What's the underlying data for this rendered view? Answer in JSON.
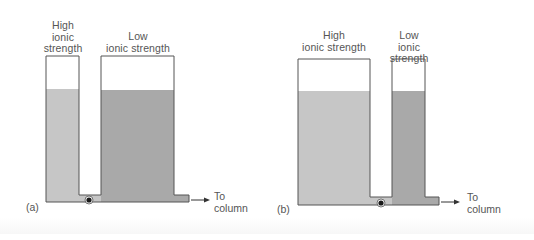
{
  "figure": {
    "panels": [
      {
        "id": "(a)",
        "left_vessel": {
          "label_lines": [
            "High",
            "ionic",
            "strength"
          ],
          "fill": "high-ionic"
        },
        "right_vessel": {
          "label_lines": [
            "Low",
            "ionic strength"
          ],
          "fill": "low-ionic"
        },
        "outlet_label_lines": [
          "To",
          "column"
        ]
      },
      {
        "id": "(b)",
        "left_vessel": {
          "label_lines": [
            "High",
            "ionic strength"
          ],
          "fill": "high-ionic"
        },
        "right_vessel": {
          "label_lines": [
            "Low",
            "ionic strength"
          ],
          "fill": "low-ionic"
        },
        "outlet_label_lines": [
          "To",
          "column"
        ]
      }
    ],
    "colors": {
      "high_ionic_fill": "#c6c6c6",
      "low_ionic_fill": "#a9a9a9",
      "vessel_outline": "#555555",
      "valve": "#1a1a1a",
      "arrow": "#333333"
    }
  }
}
